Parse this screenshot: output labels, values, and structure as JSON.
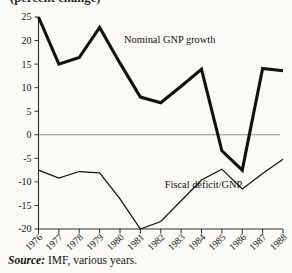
{
  "figure": {
    "clipped_title": "(percent change)",
    "source_prefix": "Source:",
    "source_text": " IMF, various years."
  },
  "chart_data": {
    "type": "line",
    "title": "(percent change)",
    "xlabel": "",
    "ylabel": "",
    "categories": [
      "1976",
      "1977",
      "1978",
      "1979",
      "1980",
      "1981",
      "1982",
      "1983",
      "1984",
      "1985",
      "1986",
      "1987",
      "1988"
    ],
    "x": [
      1976,
      1977,
      1978,
      1979,
      1980,
      1981,
      1982,
      1983,
      1984,
      1985,
      1986,
      1987,
      1988
    ],
    "ylim": [
      -20,
      25
    ],
    "yticks": [
      25,
      20,
      15,
      10,
      5,
      0,
      -5,
      -10,
      -15,
      -20
    ],
    "ytick_labels": [
      "25",
      "20",
      "15",
      "10",
      "5",
      "0",
      "-5",
      "-10",
      "-15",
      "-20"
    ],
    "grid": false,
    "legend_position": "inline-annotations",
    "zero_line": 0,
    "series": [
      {
        "name": "Nominal GNP growth",
        "style": "thick",
        "color": "#111111",
        "values": [
          25.0,
          15.0,
          16.4,
          22.8,
          15.2,
          8.0,
          6.8,
          10.3,
          13.9,
          -3.4,
          -7.5,
          14.1,
          13.6
        ]
      },
      {
        "name": "Fiscal deficit/GNP",
        "style": "thin",
        "color": "#111111",
        "values": [
          -7.5,
          -9.2,
          -7.8,
          -8.1,
          -13.6,
          -20.0,
          -18.4,
          -14.0,
          -9.6,
          -7.3,
          -11.5,
          -8.2,
          -5.2
        ]
      }
    ],
    "annotations": [
      {
        "text": "Nominal GNP growth",
        "x": 1980,
        "y": 19.5
      },
      {
        "text": "Fiscal deficit/GNP",
        "x": 1982,
        "y": -11.4
      }
    ]
  }
}
